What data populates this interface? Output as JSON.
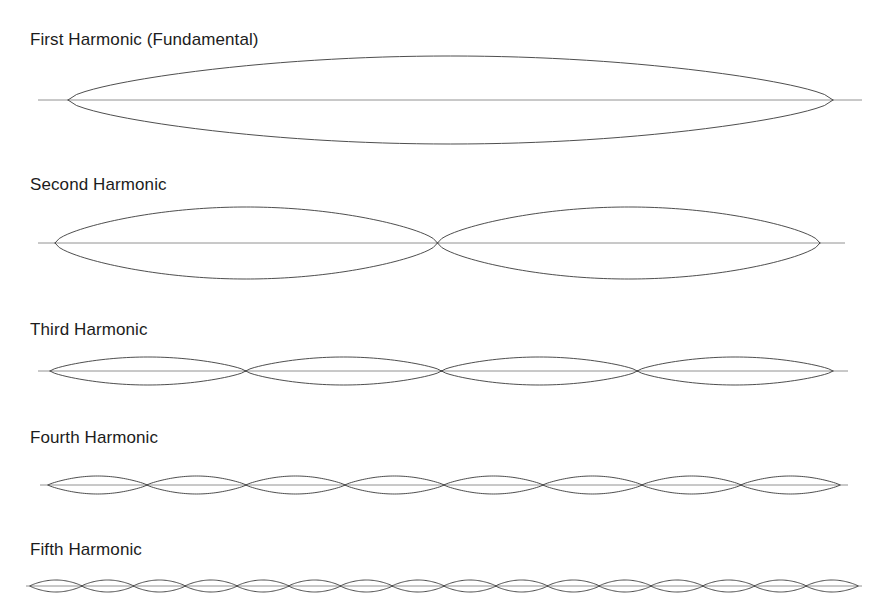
{
  "figure": {
    "background_color": "#ffffff",
    "stroke_color": "#3a3a3a",
    "axis_color": "#6e6e6e",
    "label_color": "#1c1c1c",
    "canvas": {
      "width": 887,
      "height": 616
    }
  },
  "chart_data": {
    "type": "line",
    "subtitle": "",
    "xlabel": "",
    "ylabel": "",
    "grid": false,
    "legend": "none",
    "annotations": [
      "First Harmonic (Fundamental)",
      "Second Harmonic",
      "Third Harmonic",
      "Fourth Harmonic",
      "Fifth Harmonic"
    ],
    "series": [
      {
        "name": "First Harmonic (Fundamental)",
        "loops": 1,
        "amplitude": 44,
        "x_start": 68,
        "x_end": 833,
        "axis_x_start": 38,
        "axis_x_end": 862,
        "baseline_y": 100,
        "label_y": 30
      },
      {
        "name": "Second Harmonic",
        "loops": 2,
        "amplitude": 36,
        "x_start": 55,
        "x_end": 820,
        "axis_x_start": 38,
        "axis_x_end": 845,
        "baseline_y": 243,
        "label_y": 175
      },
      {
        "name": "Third Harmonic",
        "loops": 4,
        "amplitude": 14,
        "x_start": 50,
        "x_end": 833,
        "axis_x_start": 38,
        "axis_x_end": 848,
        "baseline_y": 371,
        "label_y": 320
      },
      {
        "name": "Fourth Harmonic",
        "loops": 8,
        "amplitude": 9,
        "x_start": 48,
        "x_end": 840,
        "axis_x_start": 40,
        "axis_x_end": 848,
        "baseline_y": 485,
        "label_y": 428
      },
      {
        "name": "Fifth Harmonic",
        "loops": 16,
        "amplitude": 6,
        "x_start": 30,
        "x_end": 858,
        "axis_x_start": 26,
        "axis_x_end": 862,
        "baseline_y": 586,
        "label_y": 540
      }
    ]
  }
}
